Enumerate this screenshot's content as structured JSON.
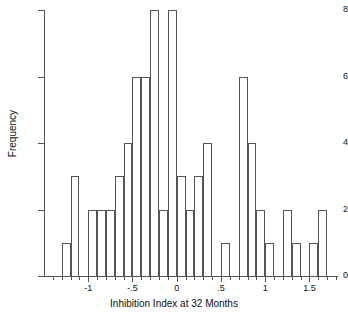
{
  "chart_data": {
    "type": "bar",
    "title": "",
    "xlabel": "Inhibition Index at 32 Months",
    "ylabel": "Frequency",
    "xlim": [
      -1.5,
      1.8
    ],
    "ylim": [
      0,
      8
    ],
    "grid": false,
    "legend": null,
    "bin_width": 0.1,
    "x_tick_labels": [
      "-1",
      "-.5",
      "0",
      ".5",
      "1",
      "1.5"
    ],
    "x_tick_values": [
      -1,
      -0.5,
      0,
      0.5,
      1,
      1.5
    ],
    "y_tick_labels": [
      "0",
      "2",
      "4",
      "6",
      "8"
    ],
    "y_tick_values": [
      0,
      2,
      4,
      6,
      8
    ],
    "bins": [
      {
        "left": -1.3,
        "right": -1.2,
        "value": 1
      },
      {
        "left": -1.2,
        "right": -1.1,
        "value": 3
      },
      {
        "left": -1.0,
        "right": -0.9,
        "value": 2
      },
      {
        "left": -0.9,
        "right": -0.8,
        "value": 2
      },
      {
        "left": -0.8,
        "right": -0.7,
        "value": 2
      },
      {
        "left": -0.7,
        "right": -0.6,
        "value": 3
      },
      {
        "left": -0.6,
        "right": -0.5,
        "value": 4
      },
      {
        "left": -0.5,
        "right": -0.4,
        "value": 6
      },
      {
        "left": -0.4,
        "right": -0.3,
        "value": 6
      },
      {
        "left": -0.3,
        "right": -0.2,
        "value": 8
      },
      {
        "left": -0.2,
        "right": -0.1,
        "value": 2
      },
      {
        "left": -0.1,
        "right": 0.0,
        "value": 8
      },
      {
        "left": 0.0,
        "right": 0.1,
        "value": 3
      },
      {
        "left": 0.1,
        "right": 0.2,
        "value": 2
      },
      {
        "left": 0.2,
        "right": 0.3,
        "value": 3
      },
      {
        "left": 0.3,
        "right": 0.4,
        "value": 4
      },
      {
        "left": 0.5,
        "right": 0.6,
        "value": 1
      },
      {
        "left": 0.7,
        "right": 0.8,
        "value": 6
      },
      {
        "left": 0.8,
        "right": 0.9,
        "value": 4
      },
      {
        "left": 0.9,
        "right": 1.0,
        "value": 2
      },
      {
        "left": 1.0,
        "right": 1.1,
        "value": 1
      },
      {
        "left": 1.2,
        "right": 1.3,
        "value": 2
      },
      {
        "left": 1.3,
        "right": 1.4,
        "value": 1
      },
      {
        "left": 1.5,
        "right": 1.6,
        "value": 1
      },
      {
        "left": 1.6,
        "right": 1.7,
        "value": 2
      }
    ],
    "colors": {
      "bar_stroke": "#555555",
      "bar_fill": "#ffffff",
      "axis": "#555555",
      "text": "#111111",
      "background": "#ffffff"
    }
  }
}
